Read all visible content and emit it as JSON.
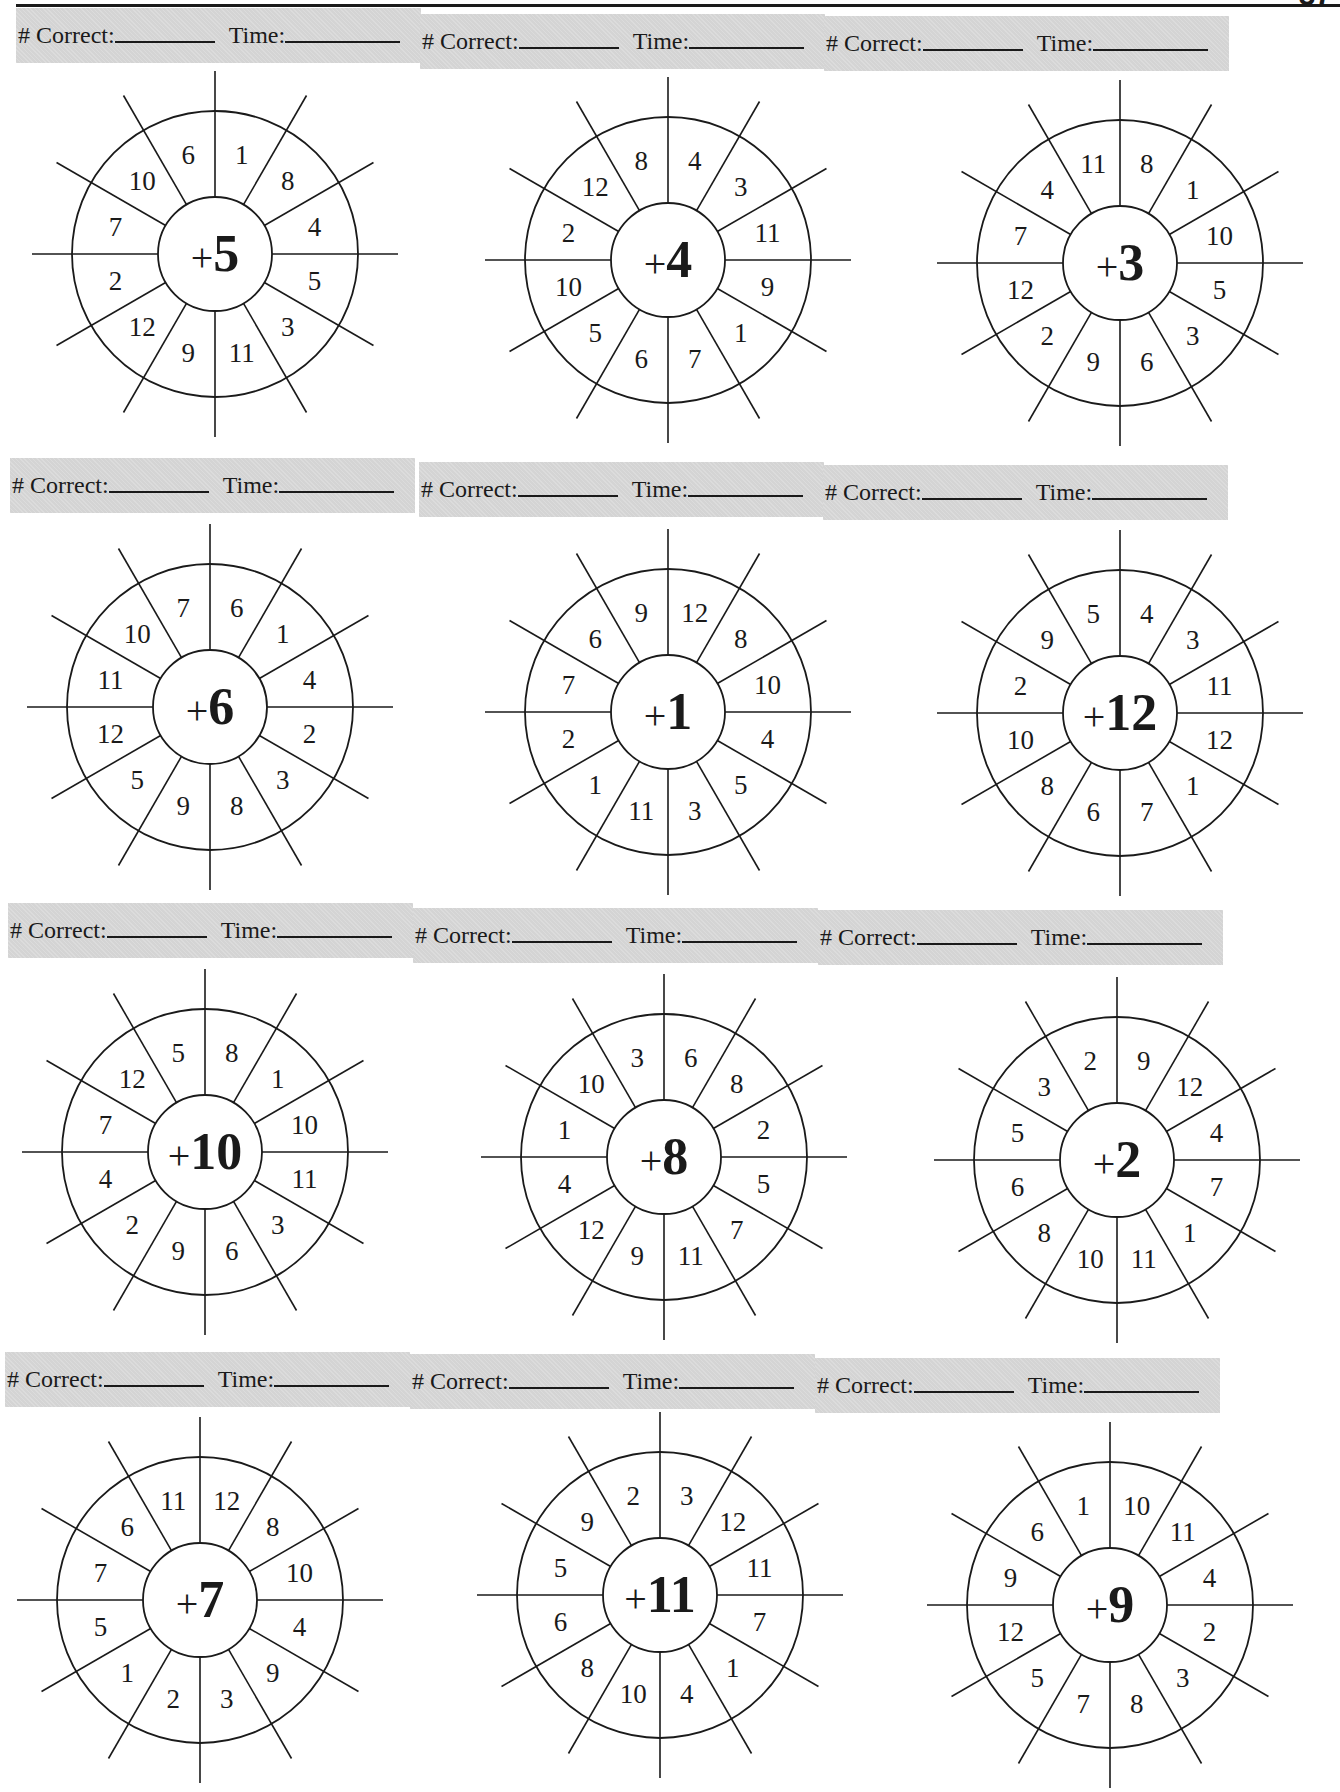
{
  "page": {
    "page_number": "37",
    "header_labels": {
      "correct": "# Correct:",
      "time": "Time:"
    }
  },
  "wheels": [
    {
      "addend": "5",
      "plus": "+",
      "numbers": [
        "1",
        "8",
        "4",
        "5",
        "3",
        "11",
        "9",
        "12",
        "2",
        "7",
        "10",
        "6"
      ]
    },
    {
      "addend": "4",
      "plus": "+",
      "numbers": [
        "4",
        "3",
        "11",
        "9",
        "1",
        "7",
        "6",
        "5",
        "10",
        "2",
        "12",
        "8"
      ]
    },
    {
      "addend": "3",
      "plus": "+",
      "numbers": [
        "8",
        "1",
        "10",
        "5",
        "3",
        "6",
        "9",
        "2",
        "12",
        "7",
        "4",
        "11"
      ]
    },
    {
      "addend": "6",
      "plus": "+",
      "numbers": [
        "6",
        "1",
        "4",
        "2",
        "3",
        "8",
        "9",
        "5",
        "12",
        "11",
        "10",
        "7"
      ]
    },
    {
      "addend": "1",
      "plus": "+",
      "numbers": [
        "12",
        "8",
        "10",
        "4",
        "5",
        "3",
        "11",
        "1",
        "2",
        "7",
        "6",
        "9"
      ]
    },
    {
      "addend": "12",
      "plus": "+",
      "numbers": [
        "4",
        "3",
        "11",
        "12",
        "1",
        "7",
        "6",
        "8",
        "10",
        "2",
        "9",
        "5"
      ]
    },
    {
      "addend": "10",
      "plus": "+",
      "numbers": [
        "8",
        "1",
        "10",
        "11",
        "3",
        "6",
        "9",
        "2",
        "4",
        "7",
        "12",
        "5"
      ]
    },
    {
      "addend": "8",
      "plus": "+",
      "numbers": [
        "6",
        "8",
        "2",
        "5",
        "7",
        "11",
        "9",
        "12",
        "4",
        "1",
        "10",
        "3"
      ]
    },
    {
      "addend": "2",
      "plus": "+",
      "numbers": [
        "9",
        "12",
        "4",
        "7",
        "1",
        "11",
        "10",
        "8",
        "6",
        "5",
        "3",
        "2"
      ]
    },
    {
      "addend": "7",
      "plus": "+",
      "numbers": [
        "12",
        "8",
        "10",
        "4",
        "9",
        "3",
        "2",
        "1",
        "5",
        "7",
        "6",
        "11"
      ]
    },
    {
      "addend": "11",
      "plus": "+",
      "numbers": [
        "3",
        "12",
        "11",
        "7",
        "1",
        "4",
        "10",
        "8",
        "6",
        "5",
        "9",
        "2"
      ]
    },
    {
      "addend": "9",
      "plus": "+",
      "numbers": [
        "10",
        "11",
        "4",
        "2",
        "3",
        "8",
        "7",
        "5",
        "12",
        "9",
        "6",
        "1"
      ]
    }
  ],
  "layout_note_colors": {
    "ink": "#1a1a1a",
    "header_band": "#d4d4d4"
  }
}
